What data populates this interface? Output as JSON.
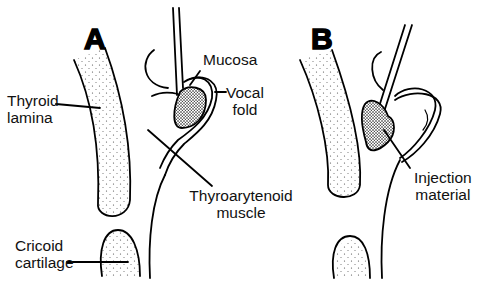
{
  "figure": {
    "panels": [
      {
        "id": "A",
        "letter": "A"
      },
      {
        "id": "B",
        "letter": "B"
      }
    ],
    "labels": {
      "thyroid_lamina": [
        "Thyroid",
        "lamina"
      ],
      "mucosa": "Mucosa",
      "vocal_fold": [
        "Vocal",
        "fold"
      ],
      "thyroarytenoid_muscle": [
        "Thyroarytenoid",
        "muscle"
      ],
      "cricoid_cartilage": [
        "Cricoid",
        "cartilage"
      ],
      "injection_material": [
        "Injection",
        "material"
      ]
    },
    "colors": {
      "line": "#000000",
      "background": "#ffffff"
    }
  }
}
